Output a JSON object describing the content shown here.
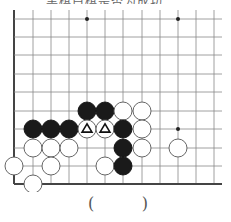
{
  "problem": {
    "caption": "……黑棋白棋是否为成功",
    "answer_open": "(",
    "answer_close": ")"
  },
  "board": {
    "columns_x": [
      14,
      33,
      51,
      69,
      87,
      105,
      123,
      142,
      160,
      178,
      196,
      214
    ],
    "rows_y": [
      19,
      37,
      55,
      74,
      92,
      111,
      129,
      148,
      166,
      184
    ],
    "right_extent_x": 222,
    "top_extent_y": 10,
    "left_edge": true,
    "bottom_edge": true,
    "line_color": "#888888",
    "edge_color": "#444444",
    "star_points": [
      [
        4,
        0
      ],
      [
        9,
        0
      ],
      [
        9,
        6
      ]
    ],
    "stone_radius": 9,
    "stones": [
      {
        "col": 4,
        "row": 5,
        "color": "black"
      },
      {
        "col": 5,
        "row": 5,
        "color": "black"
      },
      {
        "col": 6,
        "row": 5,
        "color": "white"
      },
      {
        "col": 7,
        "row": 5,
        "color": "white"
      },
      {
        "col": 1,
        "row": 6,
        "color": "black"
      },
      {
        "col": 2,
        "row": 6,
        "color": "black"
      },
      {
        "col": 3,
        "row": 6,
        "color": "black"
      },
      {
        "col": 4,
        "row": 6,
        "color": "white",
        "mark": "triangle"
      },
      {
        "col": 5,
        "row": 6,
        "color": "white",
        "mark": "triangle"
      },
      {
        "col": 6,
        "row": 6,
        "color": "black"
      },
      {
        "col": 7,
        "row": 6,
        "color": "white"
      },
      {
        "col": 1,
        "row": 7,
        "color": "white"
      },
      {
        "col": 2,
        "row": 7,
        "color": "white"
      },
      {
        "col": 3,
        "row": 7,
        "color": "white"
      },
      {
        "col": 6,
        "row": 7,
        "color": "black"
      },
      {
        "col": 7,
        "row": 7,
        "color": "white"
      },
      {
        "col": 9,
        "row": 7,
        "color": "white"
      },
      {
        "col": 0,
        "row": 8,
        "color": "white"
      },
      {
        "col": 2,
        "row": 8,
        "color": "white"
      },
      {
        "col": 5,
        "row": 8,
        "color": "white"
      },
      {
        "col": 6,
        "row": 8,
        "color": "black"
      },
      {
        "col": 1,
        "row": 9,
        "color": "white"
      }
    ]
  }
}
